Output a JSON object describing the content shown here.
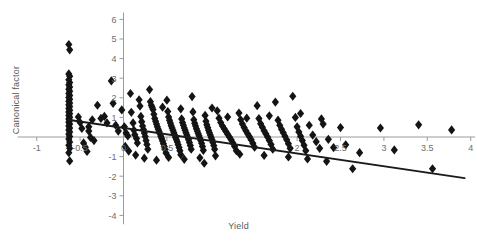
{
  "chart_data": {
    "type": "scatter",
    "title": "",
    "xlabel": "Yield",
    "ylabel": "Canonical factor",
    "xlim": [
      -1.22,
      4.05
    ],
    "ylim": [
      -4.45,
      6.35
    ],
    "xticks": [
      -1,
      -0.5,
      0,
      0.5,
      1,
      1.5,
      2,
      2.5,
      3,
      3.5,
      4
    ],
    "xtick_labels": [
      "-1",
      "-0.5",
      "0",
      "0.5",
      "1",
      "1.5",
      "2",
      "2.5",
      "3",
      "3.5",
      "4"
    ],
    "xtick_labels_shown": [
      "-1",
      "-0.5",
      "0",
      "0.5",
      "2",
      "2.5",
      "3",
      "3.5",
      "4"
    ],
    "yticks": [
      -4,
      -3,
      -2,
      -1,
      1,
      2,
      3,
      4,
      5,
      6
    ],
    "ytick_labels": [
      "-4",
      "-3",
      "-2",
      "-1",
      "1",
      "2",
      "3",
      "4",
      "5",
      "6"
    ],
    "grid": false,
    "marker": "diamond",
    "marker_color": "#141414",
    "marker_size": 4.6,
    "axis_color": "#9a9a9a",
    "trendline": {
      "name": "regression fit",
      "color": "#1a1a1a",
      "width": 1.9,
      "x_start": -0.64,
      "y_start": 0.88,
      "x_end": 3.93,
      "y_end": -2.1
    },
    "series": [
      {
        "name": "observations",
        "points": [
          [
            -0.63,
            4.72
          ],
          [
            -0.62,
            4.45
          ],
          [
            -0.63,
            3.22
          ],
          [
            -0.62,
            3.1
          ],
          [
            -0.63,
            2.92
          ],
          [
            -0.62,
            2.78
          ],
          [
            -0.63,
            2.66
          ],
          [
            -0.62,
            2.55
          ],
          [
            -0.63,
            2.44
          ],
          [
            -0.62,
            2.33
          ],
          [
            -0.63,
            2.22
          ],
          [
            -0.62,
            2.12
          ],
          [
            -0.63,
            2.02
          ],
          [
            -0.62,
            1.92
          ],
          [
            -0.63,
            1.83
          ],
          [
            -0.62,
            1.73
          ],
          [
            -0.63,
            1.64
          ],
          [
            -0.62,
            1.55
          ],
          [
            -0.63,
            1.46
          ],
          [
            -0.62,
            1.37
          ],
          [
            -0.63,
            1.28
          ],
          [
            -0.62,
            1.19
          ],
          [
            -0.63,
            1.1
          ],
          [
            -0.62,
            1.01
          ],
          [
            -0.63,
            0.92
          ],
          [
            -0.62,
            0.84
          ],
          [
            -0.63,
            0.75
          ],
          [
            -0.62,
            0.66
          ],
          [
            -0.63,
            0.56
          ],
          [
            -0.62,
            0.46
          ],
          [
            -0.63,
            0.36
          ],
          [
            -0.62,
            0.26
          ],
          [
            -0.63,
            0.14
          ],
          [
            -0.62,
            0.02
          ],
          [
            -0.63,
            -0.1
          ],
          [
            -0.62,
            -0.26
          ],
          [
            -0.63,
            -0.42
          ],
          [
            -0.62,
            -0.58
          ],
          [
            -0.63,
            -0.8
          ],
          [
            -0.62,
            -1.22
          ],
          [
            -0.4,
            0.52
          ],
          [
            -0.4,
            0.3
          ],
          [
            -0.38,
            -0.02
          ],
          [
            -0.3,
            1.62
          ],
          [
            -0.26,
            0.95
          ],
          [
            -0.22,
            1.05
          ],
          [
            -0.19,
            0.72
          ],
          [
            -0.14,
            2.86
          ],
          [
            -0.12,
            1.72
          ],
          [
            -0.09,
            0.6
          ],
          [
            -0.06,
            0.3
          ],
          [
            -0.02,
            1.38
          ],
          [
            0.01,
            0.52
          ],
          [
            0.03,
            0.2
          ],
          [
            0.05,
            0.05
          ],
          [
            0.08,
            2.22
          ],
          [
            0.09,
            1.26
          ],
          [
            0.11,
            0.72
          ],
          [
            0.12,
            0.35
          ],
          [
            0.13,
            0.12
          ],
          [
            0.15,
            -0.08
          ],
          [
            0.16,
            -0.3
          ],
          [
            0.18,
            1.9
          ],
          [
            0.19,
            1.58
          ],
          [
            0.2,
            1.05
          ],
          [
            0.21,
            0.78
          ],
          [
            0.22,
            0.56
          ],
          [
            0.23,
            0.38
          ],
          [
            0.24,
            0.2
          ],
          [
            0.25,
            0.02
          ],
          [
            0.26,
            -0.18
          ],
          [
            0.27,
            -0.38
          ],
          [
            0.28,
            -0.62
          ],
          [
            0.3,
            2.42
          ],
          [
            0.31,
            1.8
          ],
          [
            0.32,
            1.62
          ],
          [
            0.33,
            1.52
          ],
          [
            0.34,
            1.4
          ],
          [
            0.35,
            1.16
          ],
          [
            0.36,
            0.95
          ],
          [
            0.37,
            0.8
          ],
          [
            0.38,
            0.66
          ],
          [
            0.39,
            0.52
          ],
          [
            0.4,
            0.4
          ],
          [
            0.41,
            0.28
          ],
          [
            0.42,
            0.16
          ],
          [
            0.43,
            0.04
          ],
          [
            0.44,
            -0.08
          ],
          [
            0.45,
            -0.2
          ],
          [
            0.46,
            -0.34
          ],
          [
            0.47,
            -0.48
          ],
          [
            0.48,
            -0.64
          ],
          [
            0.49,
            -0.82
          ],
          [
            0.5,
            1.88
          ],
          [
            0.51,
            1.3
          ],
          [
            0.52,
            1.02
          ],
          [
            0.53,
            0.86
          ],
          [
            0.54,
            0.72
          ],
          [
            0.55,
            0.58
          ],
          [
            0.56,
            0.46
          ],
          [
            0.57,
            0.34
          ],
          [
            0.58,
            0.22
          ],
          [
            0.59,
            0.1
          ],
          [
            0.6,
            -0.02
          ],
          [
            0.61,
            -0.14
          ],
          [
            0.62,
            -0.26
          ],
          [
            0.63,
            -0.4
          ],
          [
            0.64,
            -0.54
          ],
          [
            0.65,
            -0.7
          ],
          [
            0.66,
            -0.9
          ],
          [
            0.67,
            0.92
          ],
          [
            0.68,
            0.74
          ],
          [
            0.69,
            0.6
          ],
          [
            0.7,
            0.46
          ],
          [
            0.71,
            0.34
          ],
          [
            0.72,
            0.22
          ],
          [
            0.73,
            0.1
          ],
          [
            0.74,
            -0.02
          ],
          [
            0.75,
            -0.14
          ],
          [
            0.76,
            -0.28
          ],
          [
            0.77,
            -0.44
          ],
          [
            0.78,
            -0.62
          ],
          [
            0.79,
            2.06
          ],
          [
            0.8,
            1.28
          ],
          [
            0.81,
            0.88
          ],
          [
            0.82,
            0.7
          ],
          [
            0.83,
            0.56
          ],
          [
            0.84,
            0.42
          ],
          [
            0.85,
            0.3
          ],
          [
            0.86,
            0.18
          ],
          [
            0.87,
            0.06
          ],
          [
            0.88,
            -0.06
          ],
          [
            0.89,
            -0.18
          ],
          [
            0.9,
            -0.32
          ],
          [
            0.91,
            -0.48
          ],
          [
            0.92,
            -0.68
          ],
          [
            0.93,
            -1.34
          ],
          [
            0.94,
            1.1
          ],
          [
            0.95,
            0.8
          ],
          [
            0.96,
            0.62
          ],
          [
            0.97,
            0.48
          ],
          [
            0.98,
            0.34
          ],
          [
            0.99,
            0.22
          ],
          [
            1.0,
            0.1
          ],
          [
            1.01,
            -0.02
          ],
          [
            1.02,
            -0.14
          ],
          [
            1.03,
            -0.28
          ],
          [
            1.04,
            -0.44
          ],
          [
            1.05,
            -0.62
          ],
          [
            1.08,
            1.34
          ],
          [
            1.1,
            0.96
          ],
          [
            1.12,
            0.74
          ],
          [
            1.14,
            0.56
          ],
          [
            1.16,
            0.42
          ],
          [
            1.18,
            0.28
          ],
          [
            1.2,
            0.14
          ],
          [
            1.22,
            0.0
          ],
          [
            1.24,
            -0.14
          ],
          [
            1.26,
            -0.3
          ],
          [
            1.28,
            -0.48
          ],
          [
            1.3,
            -0.7
          ],
          [
            1.33,
            1.22
          ],
          [
            1.35,
            0.88
          ],
          [
            1.37,
            0.66
          ],
          [
            1.39,
            0.48
          ],
          [
            1.41,
            0.32
          ],
          [
            1.43,
            0.16
          ],
          [
            1.45,
            0.02
          ],
          [
            1.47,
            -0.14
          ],
          [
            1.49,
            -0.32
          ],
          [
            1.51,
            -0.52
          ],
          [
            1.54,
            1.6
          ],
          [
            1.56,
            0.94
          ],
          [
            1.58,
            0.68
          ],
          [
            1.6,
            0.5
          ],
          [
            1.62,
            0.32
          ],
          [
            1.64,
            0.16
          ],
          [
            1.66,
            0.0
          ],
          [
            1.68,
            -0.18
          ],
          [
            1.7,
            -0.38
          ],
          [
            1.72,
            -0.62
          ],
          [
            1.75,
            1.78
          ],
          [
            1.78,
            0.86
          ],
          [
            1.8,
            0.6
          ],
          [
            1.82,
            0.4
          ],
          [
            1.84,
            0.22
          ],
          [
            1.86,
            0.04
          ],
          [
            1.88,
            -0.14
          ],
          [
            1.9,
            -0.34
          ],
          [
            1.92,
            -0.58
          ],
          [
            1.95,
            2.08
          ],
          [
            1.98,
            1.0
          ],
          [
            2.0,
            0.52
          ],
          [
            2.02,
            0.26
          ],
          [
            2.04,
            0.04
          ],
          [
            2.06,
            -0.18
          ],
          [
            2.08,
            -0.42
          ],
          [
            2.1,
            -0.7
          ],
          [
            2.14,
            0.6
          ],
          [
            2.18,
            0.1
          ],
          [
            2.22,
            -0.24
          ],
          [
            2.26,
            -0.58
          ],
          [
            2.3,
            0.66
          ],
          [
            2.36,
            -0.12
          ],
          [
            2.42,
            -0.54
          ],
          [
            2.5,
            0.48
          ],
          [
            2.56,
            -0.4
          ],
          [
            2.64,
            -1.62
          ],
          [
            2.72,
            -0.8
          ],
          [
            2.96,
            0.46
          ],
          [
            3.12,
            -0.66
          ],
          [
            3.4,
            0.62
          ],
          [
            3.56,
            -1.62
          ],
          [
            3.78,
            0.36
          ],
          [
            -0.52,
            1.02
          ],
          [
            -0.5,
            0.74
          ],
          [
            -0.48,
            0.44
          ],
          [
            -0.46,
            -0.3
          ],
          [
            -0.44,
            -0.52
          ],
          [
            -0.42,
            -0.74
          ],
          [
            -0.36,
            0.88
          ],
          [
            -0.34,
            -0.18
          ],
          [
            0.02,
            -0.48
          ],
          [
            0.06,
            -0.72
          ],
          [
            0.14,
            -0.92
          ],
          [
            0.24,
            -1.08
          ],
          [
            0.38,
            -1.18
          ],
          [
            0.52,
            -1.04
          ],
          [
            0.7,
            -1.14
          ],
          [
            0.88,
            -1.06
          ],
          [
            1.06,
            -0.96
          ],
          [
            1.34,
            -0.88
          ],
          [
            1.62,
            -0.94
          ],
          [
            1.9,
            -1.02
          ],
          [
            2.12,
            -1.12
          ],
          [
            2.34,
            -1.24
          ],
          [
            0.45,
            1.52
          ],
          [
            0.66,
            1.44
          ],
          [
            1.02,
            1.48
          ],
          [
            1.2,
            1.02
          ],
          [
            1.42,
            0.96
          ],
          [
            1.68,
            1.08
          ],
          [
            2.04,
            1.2
          ],
          [
            2.28,
            0.92
          ]
        ]
      }
    ]
  },
  "axis_labels": {
    "x_title": "Yield",
    "y_title": "Canonical factor"
  }
}
